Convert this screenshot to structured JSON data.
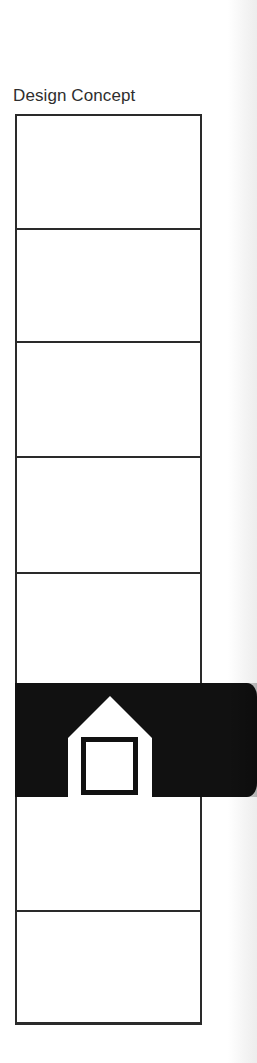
{
  "title": "Design Concept",
  "diagram": {
    "cell_count": 8,
    "highlighted_cell_index": 5,
    "highlight_icon": "house-icon",
    "colors": {
      "line": "#2a2a2a",
      "band": "#111111",
      "icon_fill": "#ffffff",
      "background": "#ffffff"
    }
  }
}
